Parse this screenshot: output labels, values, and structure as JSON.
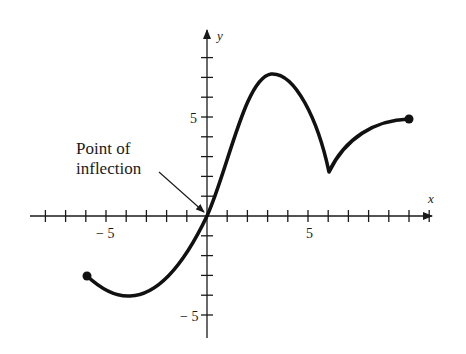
{
  "chart_data": {
    "type": "line",
    "title": "",
    "xlabel": "x",
    "ylabel": "y",
    "xlim": [
      -9,
      12
    ],
    "ylim": [
      -6,
      9
    ],
    "grid": false,
    "x_ticks": [
      -8,
      -7,
      -6,
      -5,
      -4,
      -3,
      -2,
      -1,
      1,
      2,
      3,
      4,
      5,
      6,
      7,
      8,
      9,
      10,
      11
    ],
    "y_ticks": [
      -5,
      -4,
      -3,
      -2,
      -1,
      1,
      2,
      3,
      4,
      5,
      6,
      7,
      8
    ],
    "x_tick_labels": [
      {
        "value": -5,
        "text": "− 5"
      },
      {
        "value": 5,
        "text": "5"
      }
    ],
    "y_tick_labels": [
      {
        "value": 5,
        "text": "5"
      },
      {
        "value": -5,
        "text": "− 5"
      }
    ],
    "series": [
      {
        "name": "f(x)",
        "points": [
          {
            "x": -6.0,
            "y": -3.0
          },
          {
            "x": -5.0,
            "y": -3.7
          },
          {
            "x": -3.9,
            "y": -4.0
          },
          {
            "x": -2.5,
            "y": -3.6
          },
          {
            "x": -1.0,
            "y": -2.0
          },
          {
            "x": 0.0,
            "y": 0.0
          },
          {
            "x": 1.0,
            "y": 3.2
          },
          {
            "x": 2.0,
            "y": 6.0
          },
          {
            "x": 3.2,
            "y": 7.1
          },
          {
            "x": 4.5,
            "y": 6.0
          },
          {
            "x": 5.5,
            "y": 4.0
          },
          {
            "x": 6.1,
            "y": 2.2
          },
          {
            "x": 7.0,
            "y": 3.6
          },
          {
            "x": 8.5,
            "y": 4.6
          },
          {
            "x": 10.1,
            "y": 4.9
          }
        ],
        "endpoints_filled": [
          {
            "x": -6.0,
            "y": -3.0
          },
          {
            "x": 10.1,
            "y": 4.9
          }
        ],
        "features": {
          "local_min": {
            "x": -3.9,
            "y": -4.0
          },
          "local_max": {
            "x": 3.2,
            "y": 7.1
          },
          "cusp": {
            "x": 6.1,
            "y": 2.2
          },
          "inflection_point": {
            "x": 0,
            "y": 0
          }
        }
      }
    ],
    "annotations": [
      {
        "text_line1": "Point of",
        "text_line2": "inflection",
        "points_to": {
          "x": 0,
          "y": 0
        }
      }
    ]
  },
  "labels": {
    "x_axis": "x",
    "y_axis": "y",
    "x_neg5": "− 5",
    "x_pos5": "5",
    "y_pos5": "5",
    "y_neg5": "− 5",
    "annot_line1": "Point of",
    "annot_line2": "inflection"
  },
  "colors": {
    "ink": "#1a1a1a",
    "background": "#ffffff"
  }
}
